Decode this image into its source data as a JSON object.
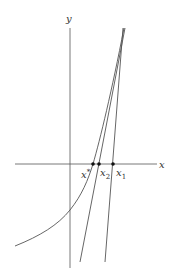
{
  "diagram": {
    "type": "newton-method",
    "axes": {
      "x_label": "x",
      "y_label": "y"
    },
    "points": [
      {
        "id": "x-star",
        "label": "x*",
        "base": "x",
        "sup": "*"
      },
      {
        "id": "x2",
        "label": "x2",
        "base": "x",
        "sub": "2"
      },
      {
        "id": "x1",
        "label": "x1",
        "base": "x",
        "sub": "1"
      }
    ],
    "colors": {
      "line": "#555555",
      "point": "#111111",
      "background": "#ffffff"
    }
  }
}
